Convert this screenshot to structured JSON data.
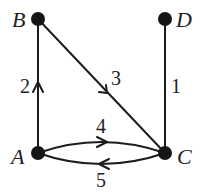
{
  "graph": {
    "type": "mixed directed graph",
    "nodes": [
      {
        "id": "A",
        "label": "A",
        "x": 38,
        "y": 153
      },
      {
        "id": "B",
        "label": "B",
        "x": 38,
        "y": 19
      },
      {
        "id": "C",
        "label": "C",
        "x": 165,
        "y": 153
      },
      {
        "id": "D",
        "label": "D",
        "x": 165,
        "y": 19
      }
    ],
    "edges": [
      {
        "from": "A",
        "to": "B",
        "weight": "2",
        "directed": true
      },
      {
        "from": "B",
        "to": "C",
        "weight": "3",
        "directed": true
      },
      {
        "from": "D",
        "to": "C",
        "weight": "1",
        "directed": false
      },
      {
        "from": "A",
        "to": "C",
        "weight": "4",
        "directed": true
      },
      {
        "from": "C",
        "to": "A",
        "weight": "5",
        "directed": true
      }
    ]
  },
  "colors": {
    "line": "#1c1c1c",
    "node": "#151515",
    "background": "#ffffff"
  }
}
